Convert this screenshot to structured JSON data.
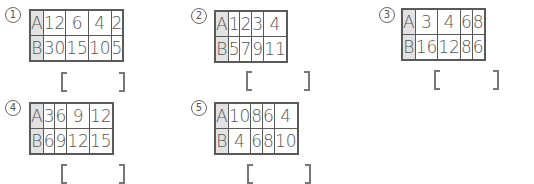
{
  "problems": [
    {
      "number": "1",
      "label": "①",
      "rows": [
        {
          "header": "A",
          "values": [
            "12",
            "6",
            "4",
            "2"
          ]
        },
        {
          "header": "B",
          "values": [
            "30",
            "15",
            "10",
            "5"
          ]
        }
      ],
      "answer": ""
    },
    {
      "number": "2",
      "label": "②",
      "rows": [
        {
          "header": "A",
          "values": [
            "1",
            "2",
            "3",
            "4"
          ]
        },
        {
          "header": "B",
          "values": [
            "5",
            "7",
            "9",
            "11"
          ]
        }
      ],
      "answer": ""
    },
    {
      "number": "3",
      "label": "③",
      "rows": [
        {
          "header": "A",
          "values": [
            "3",
            "4",
            "6",
            "8"
          ]
        },
        {
          "header": "B",
          "values": [
            "16",
            "12",
            "8",
            "6"
          ]
        }
      ],
      "answer": ""
    },
    {
      "number": "4",
      "label": "④",
      "rows": [
        {
          "header": "A",
          "values": [
            "3",
            "6",
            "9",
            "12"
          ]
        },
        {
          "header": "B",
          "values": [
            "6",
            "9",
            "12",
            "15"
          ]
        }
      ],
      "answer": ""
    },
    {
      "number": "5",
      "label": "⑤",
      "rows": [
        {
          "header": "A",
          "values": [
            "10",
            "8",
            "6",
            "4"
          ]
        },
        {
          "header": "B",
          "values": [
            "4",
            "6",
            "8",
            "10"
          ]
        }
      ],
      "answer": ""
    }
  ],
  "colors": {
    "header_fill": "#e2e2e2",
    "border": "#5a5a5a",
    "text": "#555555"
  }
}
